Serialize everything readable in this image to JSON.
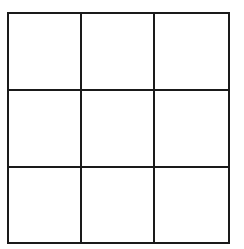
{
  "board": {
    "rows": 3,
    "cols": 3,
    "line_color": "#1a1a1a",
    "background": "#ffffff",
    "cells": [
      [
        "",
        "",
        ""
      ],
      [
        "",
        "",
        ""
      ],
      [
        "",
        "",
        ""
      ]
    ]
  }
}
